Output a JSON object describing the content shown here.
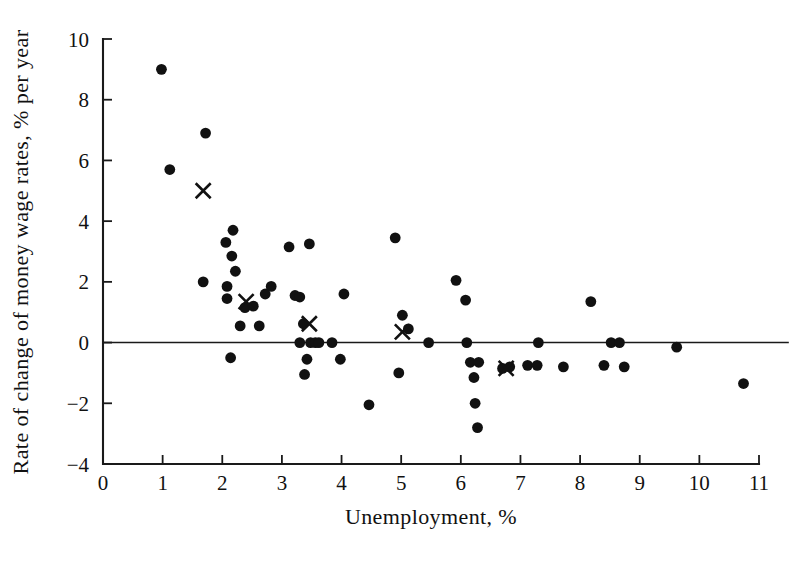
{
  "chart_data": {
    "type": "scatter",
    "title": "",
    "xlabel": "Unemployment, %",
    "ylabel": "Rate of change of money wage rates, % per year",
    "xlim": [
      0,
      11
    ],
    "ylim": [
      -4,
      10
    ],
    "xticks": [
      0,
      1,
      2,
      3,
      4,
      5,
      6,
      7,
      8,
      9,
      10,
      11
    ],
    "yticks": [
      -4,
      -2,
      0,
      2,
      4,
      6,
      8,
      10
    ],
    "xtick_labels": [
      "0",
      "1",
      "2",
      "3",
      "4",
      "5",
      "6",
      "7",
      "8",
      "9",
      "10",
      "11"
    ],
    "ytick_labels": [
      "−4",
      "−2",
      "0",
      "2",
      "4",
      "6",
      "8",
      "10"
    ],
    "grid": false,
    "legend": "none",
    "reference_lines": [
      {
        "name": "zero-line",
        "axis": "y",
        "value": 0,
        "x_from": 0,
        "x_to": 11.5
      }
    ],
    "series": [
      {
        "name": "observations",
        "marker": "filled-circle",
        "color": "#111111",
        "points": [
          [
            0.98,
            9.0
          ],
          [
            1.12,
            5.7
          ],
          [
            1.72,
            6.9
          ],
          [
            1.68,
            2.0
          ],
          [
            2.06,
            3.3
          ],
          [
            2.18,
            3.7
          ],
          [
            2.16,
            2.85
          ],
          [
            2.08,
            1.85
          ],
          [
            2.08,
            1.45
          ],
          [
            2.22,
            2.35
          ],
          [
            2.38,
            1.15
          ],
          [
            2.52,
            1.2
          ],
          [
            2.3,
            0.55
          ],
          [
            2.62,
            0.55
          ],
          [
            2.14,
            -0.5
          ],
          [
            2.72,
            1.6
          ],
          [
            2.82,
            1.85
          ],
          [
            3.12,
            3.15
          ],
          [
            3.22,
            1.55
          ],
          [
            3.3,
            1.5
          ],
          [
            3.36,
            0.62
          ],
          [
            3.3,
            0.0
          ],
          [
            3.48,
            0.0
          ],
          [
            3.56,
            0.0
          ],
          [
            3.62,
            0.0
          ],
          [
            3.84,
            0.0
          ],
          [
            3.42,
            -0.55
          ],
          [
            3.38,
            -1.05
          ],
          [
            3.46,
            3.25
          ],
          [
            3.98,
            -0.55
          ],
          [
            4.04,
            1.6
          ],
          [
            4.46,
            -2.05
          ],
          [
            4.9,
            3.45
          ],
          [
            5.02,
            0.9
          ],
          [
            5.12,
            0.45
          ],
          [
            4.96,
            -1.0
          ],
          [
            5.46,
            0.0
          ],
          [
            6.08,
            1.4
          ],
          [
            5.92,
            2.05
          ],
          [
            6.1,
            0.0
          ],
          [
            6.16,
            -0.65
          ],
          [
            6.3,
            -0.65
          ],
          [
            6.22,
            -1.15
          ],
          [
            6.24,
            -2.0
          ],
          [
            6.28,
            -2.8
          ],
          [
            6.7,
            -0.85
          ],
          [
            6.82,
            -0.8
          ],
          [
            7.12,
            -0.75
          ],
          [
            7.28,
            -0.75
          ],
          [
            7.3,
            0.0
          ],
          [
            7.72,
            -0.8
          ],
          [
            8.18,
            1.35
          ],
          [
            8.4,
            -0.75
          ],
          [
            8.52,
            0.0
          ],
          [
            8.66,
            0.0
          ],
          [
            8.74,
            -0.8
          ],
          [
            9.62,
            -0.15
          ],
          [
            10.74,
            -1.35
          ]
        ]
      },
      {
        "name": "cross-observations",
        "marker": "cross",
        "color": "#111111",
        "points": [
          [
            1.68,
            5.0
          ],
          [
            2.4,
            1.35
          ],
          [
            3.46,
            0.62
          ],
          [
            5.02,
            0.35
          ],
          [
            6.76,
            -0.85
          ]
        ]
      }
    ]
  },
  "figure": {
    "plot_left_px": 103,
    "plot_right_px": 759,
    "plot_top_px": 39,
    "plot_bottom_px": 464
  }
}
